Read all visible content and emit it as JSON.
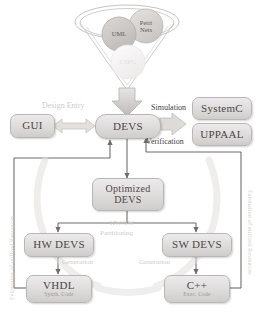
{
  "diagram": {
    "funnel": {
      "name": "model-funnel",
      "inputs": [
        {
          "id": "uml",
          "label": "UML"
        },
        {
          "id": "petri-nets",
          "label": "Petri\nNets"
        },
        {
          "id": "csfg",
          "label": "CSFG"
        }
      ]
    },
    "nodes": [
      {
        "id": "gui",
        "label": "GUI",
        "sub": ""
      },
      {
        "id": "devs",
        "label": "DEVS",
        "sub": ""
      },
      {
        "id": "systemc",
        "label": "SystemC",
        "sub": ""
      },
      {
        "id": "uppaal",
        "label": "UPPAAL",
        "sub": ""
      },
      {
        "id": "optimized-devs",
        "label": "Optimized",
        "label2": "DEVS",
        "sub": ""
      },
      {
        "id": "hw-devs",
        "label": "HW DEVS",
        "sub": ""
      },
      {
        "id": "sw-devs",
        "label": "SW DEVS",
        "sub": ""
      },
      {
        "id": "vhdl",
        "label": "VHDL",
        "sub": "Synth. Code"
      },
      {
        "id": "cpp",
        "label": "C++",
        "sub": "Exec. Code"
      }
    ],
    "edge_labels": {
      "design_entry": "Design Entry",
      "simulation": "Simulation",
      "verification": "Verification",
      "partitioning_line1": "HW/SW",
      "partitioning_line2": "Partitioning",
      "generation_left": "Generation",
      "generation_right": "Generation",
      "feedback_left": "Estimation of utilized Resources",
      "feedback_right": "Estimation of utilized Resources"
    },
    "colors": {
      "node_fill": "#dedbdb",
      "node_border": "#b9b6b6",
      "text": "#4a4846",
      "faint_text": "#cfcbc8",
      "arrow_dark": "#6f6d6b",
      "arrow_light": "#dcd9d7",
      "circle_uml": "#c9c6c4",
      "circle_petri": "#d6d3d1",
      "circle_csfg": "#f0eeed"
    }
  }
}
